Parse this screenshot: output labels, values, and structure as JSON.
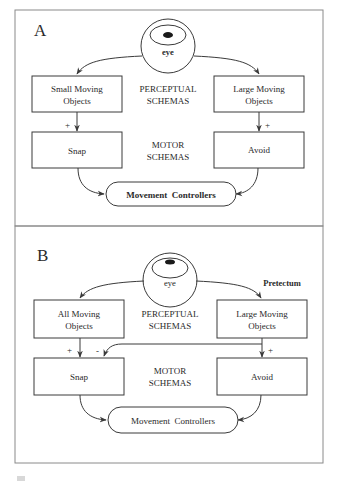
{
  "panels": [
    {
      "letter": "A",
      "eye_label": "eye",
      "perceptual_left": [
        "Small Moving",
        "Objects"
      ],
      "perceptual_right": [
        "Large Moving",
        "Objects"
      ],
      "perceptual_heading": [
        "PERCEPTUAL",
        "SCHEMAS"
      ],
      "motor_left": "Snap",
      "motor_right": "Avoid",
      "motor_heading": [
        "MOTOR",
        "SCHEMAS"
      ],
      "controller": "Movement  Controllers",
      "sign_left": "+",
      "sign_right": "+"
    },
    {
      "letter": "B",
      "eye_label": "eye",
      "region_label": "Pretectum",
      "perceptual_left": [
        "All Moving",
        "Objects"
      ],
      "perceptual_right": [
        "Large Moving",
        "Objects"
      ],
      "perceptual_heading": [
        "PERCEPTUAL",
        "SCHEMAS"
      ],
      "motor_left": "Snap",
      "motor_right": "Avoid",
      "motor_heading": [
        "MOTOR",
        "SCHEMAS"
      ],
      "controller": "Movement  Controllers",
      "sign_left": "+",
      "sign_inhibit": "-",
      "sign_right": "+"
    }
  ],
  "colors": {
    "line": "#3a3a3a",
    "frame": "#8a8a8a",
    "text": "#2a2a2a",
    "background": "#ffffff"
  }
}
